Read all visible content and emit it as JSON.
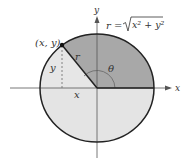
{
  "diagram": {
    "point_label": "(x, y)",
    "radius_label": "r",
    "angle_label": "θ",
    "x_leg_label": "x",
    "y_leg_label": "y",
    "x_axis_label": "x",
    "y_axis_label": "y",
    "formula": {
      "lhs": "r = ",
      "radicand": "x² + y²"
    },
    "colors": {
      "upper_half": "#a8a8a8",
      "lower_half": "#e4e4e4",
      "triangle": "#e8e8e8",
      "outline": "#222222",
      "axis": "#555555"
    }
  }
}
